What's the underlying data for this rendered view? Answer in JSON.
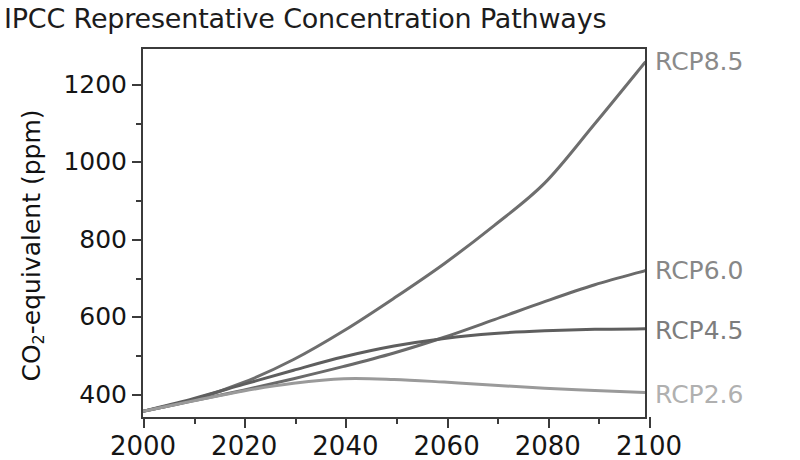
{
  "chart_data": {
    "type": "line",
    "title": "IPCC Representative Concentration Pathways",
    "xlabel": "",
    "ylabel": "CO2-equivalent (ppm)",
    "ylabel_parts": {
      "pre": "CO",
      "sub": "2",
      "post": "-equivalent (ppm)"
    },
    "xlim": [
      2000,
      2100
    ],
    "ylim": [
      330,
      1290
    ],
    "grid": false,
    "legend_position": "right-of-axes (inline end-of-line labels)",
    "x_ticks_major": [
      2000,
      2020,
      2040,
      2060,
      2080,
      2100
    ],
    "x_ticks_minor": [
      2010,
      2030,
      2050,
      2070,
      2090
    ],
    "y_ticks_major": [
      400,
      600,
      800,
      1000,
      1200
    ],
    "y_ticks_minor": [
      500,
      700,
      900,
      1100
    ],
    "x": [
      2000,
      2010,
      2020,
      2030,
      2040,
      2050,
      2060,
      2070,
      2080,
      2090,
      2100
    ],
    "series": [
      {
        "name": "RCP8.5",
        "color": "#6e6e6e",
        "label_color": "#8a8a8a",
        "label_value": 1255,
        "values": [
          345,
          375,
          420,
          480,
          555,
          640,
          730,
          830,
          940,
          1095,
          1255
        ]
      },
      {
        "name": "RCP6.0",
        "color": "#6a6a6a",
        "label_color": "#878787",
        "label_value": 715,
        "values": [
          345,
          372,
          400,
          430,
          462,
          497,
          538,
          584,
          631,
          675,
          712
        ]
      },
      {
        "name": "RCP4.5",
        "color": "#5e5e5e",
        "label_color": "#7d7d7d",
        "label_value": 560,
        "values": [
          345,
          378,
          415,
          452,
          487,
          515,
          535,
          548,
          555,
          559,
          560
        ]
      },
      {
        "name": "RCP2.6",
        "color": "#9a9a9a",
        "label_color": "#b0b0b0",
        "label_value": 395,
        "values": [
          345,
          372,
          398,
          418,
          430,
          428,
          421,
          413,
          405,
          399,
          394
        ]
      }
    ]
  },
  "axes": {
    "frame_color": "#3b3b3b",
    "tick_label_color": "#151515"
  }
}
